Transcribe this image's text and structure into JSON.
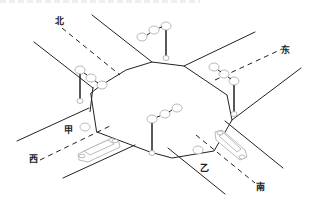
{
  "diagram": {
    "title": "",
    "type": "intersection-diagram",
    "colors": {
      "road_line": "#222222",
      "lamp_outline": "#aaaaaa",
      "car_outline": "#bbbbbb",
      "background": "#ffffff"
    },
    "direction_labels": {
      "north": "北",
      "east": "东",
      "west": "西",
      "south": "南"
    },
    "vehicle_labels": {
      "a": "甲",
      "b": "乙"
    },
    "traffic_lights": [
      {
        "position": "north",
        "icon": "traffic-light-icon"
      },
      {
        "position": "north-west",
        "icon": "traffic-light-icon"
      },
      {
        "position": "east",
        "icon": "traffic-light-icon"
      },
      {
        "position": "south",
        "icon": "traffic-light-icon"
      }
    ],
    "vehicles": [
      {
        "label_key": "a",
        "road": "west",
        "icon": "car-icon"
      },
      {
        "label_key": "b",
        "road": "south",
        "icon": "car-icon"
      }
    ]
  }
}
